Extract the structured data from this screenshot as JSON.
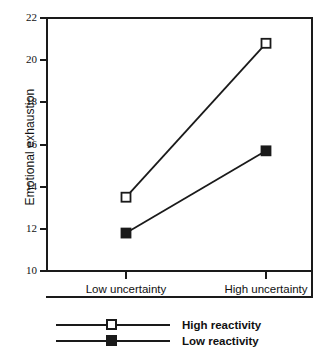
{
  "chart_data": {
    "type": "line",
    "title": "",
    "xlabel": "",
    "ylabel": "Emotional exhaustion",
    "categories": [
      "Low uncertainty",
      "High uncertainty"
    ],
    "ylim": [
      10,
      22
    ],
    "yticks": [
      10,
      12,
      14,
      16,
      18,
      20,
      22
    ],
    "ytick_labels": [
      "10",
      "12",
      "14",
      "16",
      "18",
      "20",
      "22"
    ],
    "grid": false,
    "legend_position": "below-left",
    "series": [
      {
        "name": "High reactivity",
        "marker": "open-square",
        "values": [
          13.5,
          20.8
        ]
      },
      {
        "name": "Low reactivity",
        "marker": "filled-square",
        "values": [
          11.8,
          15.7
        ]
      }
    ],
    "colors": {
      "line": "#1a1a1a",
      "marker_open_fill": "#ffffff",
      "marker_filled_fill": "#1a1a1a",
      "background": "#ffffff"
    }
  },
  "legend": {
    "entries": [
      {
        "label": "High reactivity",
        "marker": "open-square"
      },
      {
        "label": "Low reactivity",
        "marker": "filled-square"
      }
    ]
  }
}
